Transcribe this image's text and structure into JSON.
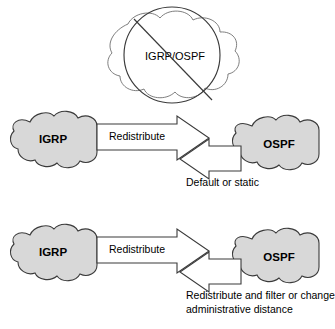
{
  "diagram": {
    "type": "network-redistribution-diagram",
    "background_color": "#ffffff",
    "palette": {
      "cloud_fill": "#d8d8d8",
      "cloud_stroke": "#3a3a3a",
      "open_cloud_fill": "#ffffff",
      "open_cloud_stroke": "#6f6f6f",
      "arrow_fill": "#ffffff",
      "arrow_stroke": "#3a3a3a",
      "text_color": "#000000"
    },
    "sections": [
      {
        "id": "prohibited",
        "name": "prohibited-combined-cloud",
        "cloud": {
          "label": "IGRP/OSPF",
          "filled": false
        },
        "overlay": {
          "name": "no-symbol",
          "shape": "circle-with-diagonal-slash",
          "slash_direction": "upper-left-to-lower-right"
        }
      },
      {
        "id": "default-or-static",
        "name": "redistribution-default-static",
        "left_cloud": {
          "label": "IGRP",
          "filled": true
        },
        "right_cloud": {
          "label": "OSPF",
          "filled": true
        },
        "forward_arrow": {
          "label": "Redistribute",
          "direction": "right"
        },
        "return_arrow": {
          "label": "",
          "direction": "left"
        },
        "caption": [
          "Default or static"
        ]
      },
      {
        "id": "redistribute-filter",
        "name": "redistribution-filter-admin-distance",
        "left_cloud": {
          "label": "IGRP",
          "filled": true
        },
        "right_cloud": {
          "label": "OSPF",
          "filled": true
        },
        "forward_arrow": {
          "label": "Redistribute",
          "direction": "right"
        },
        "return_arrow": {
          "label": "",
          "direction": "left"
        },
        "caption": [
          "Redistribute and filter or change",
          "administrative distance"
        ]
      }
    ]
  }
}
